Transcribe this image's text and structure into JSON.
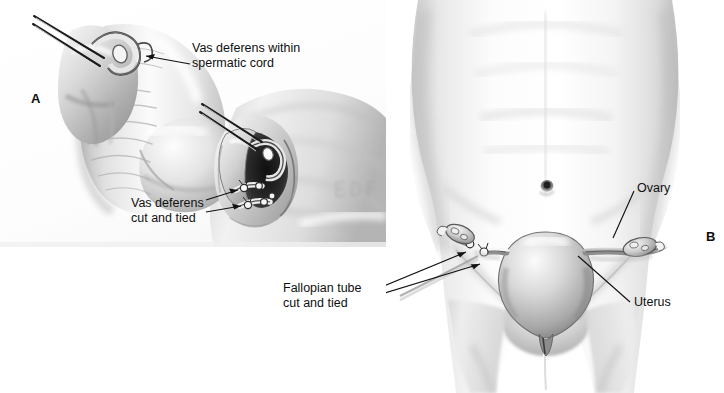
{
  "figure": {
    "background_color": "#ffffff",
    "ink_color": "#101010",
    "width": 724,
    "height": 393
  },
  "panels": [
    {
      "letter": "A",
      "name": "vasectomy",
      "description": "Male sterilization: vas deferens within spermatic cord is cut and tied through a scrotal incision"
    },
    {
      "letter": "B",
      "name": "tubal-ligation",
      "description": "Female sterilization: fallopian tube cut and tied; uterus and ovary shown in lower abdomen"
    }
  ],
  "callouts": {
    "vas_within_spermatic_cord": "Vas deferens within\nspermatic cord",
    "vas_cut_and_tied": "Vas deferens\ncut and tied",
    "fallopian_cut_and_tied": "Fallopian tube\ncut and tied",
    "ovary": "Ovary",
    "uterus": "Uterus"
  },
  "anatomy_labels": {
    "ovary": "Ovary",
    "uterus": "Uterus",
    "vas_deferens": "Vas deferens",
    "spermatic_cord": "spermatic cord",
    "fallopian_tube": "Fallopian tube"
  }
}
